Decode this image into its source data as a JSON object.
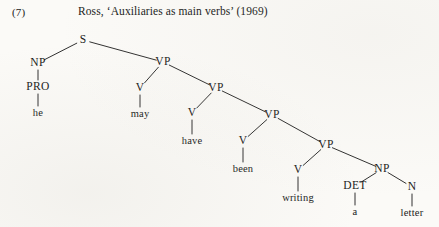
{
  "header": {
    "example_number": "(7)",
    "caption": "Ross, ‘Auxiliaries as main verbs’ (1969)"
  },
  "figure": {
    "kind": "syntax-tree",
    "sentence": "he may have been writing a letter",
    "ink_color": "#1a1a1a",
    "paper_color": "#fbfaf7"
  },
  "tree": {
    "nodes": [
      {
        "id": "S",
        "label": "S",
        "x": 83,
        "y": 40,
        "terminal": false
      },
      {
        "id": "NP1",
        "label": "NP",
        "x": 38,
        "y": 63,
        "terminal": false
      },
      {
        "id": "PRO",
        "label": "PRO",
        "x": 38,
        "y": 87,
        "terminal": false
      },
      {
        "id": "he",
        "label": "he",
        "x": 38,
        "y": 113,
        "terminal": true
      },
      {
        "id": "VP1",
        "label": "VP",
        "x": 163,
        "y": 62,
        "terminal": false
      },
      {
        "id": "V1",
        "label": "V",
        "x": 140,
        "y": 88,
        "terminal": false
      },
      {
        "id": "may",
        "label": "may",
        "x": 140,
        "y": 114,
        "terminal": true
      },
      {
        "id": "VP2",
        "label": "VP",
        "x": 216,
        "y": 88,
        "terminal": false
      },
      {
        "id": "V2",
        "label": "V",
        "x": 192,
        "y": 113,
        "terminal": false
      },
      {
        "id": "have",
        "label": "have",
        "x": 192,
        "y": 141,
        "terminal": true
      },
      {
        "id": "VP3",
        "label": "VP",
        "x": 272,
        "y": 115,
        "terminal": false
      },
      {
        "id": "V3",
        "label": "V",
        "x": 243,
        "y": 141,
        "terminal": false
      },
      {
        "id": "been",
        "label": "been",
        "x": 243,
        "y": 169,
        "terminal": true
      },
      {
        "id": "VP4",
        "label": "VP",
        "x": 326,
        "y": 145,
        "terminal": false
      },
      {
        "id": "V4",
        "label": "V",
        "x": 298,
        "y": 170,
        "terminal": false
      },
      {
        "id": "writing",
        "label": "writing",
        "x": 298,
        "y": 198,
        "terminal": true
      },
      {
        "id": "NP2",
        "label": "NP",
        "x": 382,
        "y": 169,
        "terminal": false
      },
      {
        "id": "DET",
        "label": "DET",
        "x": 355,
        "y": 186,
        "terminal": false
      },
      {
        "id": "a",
        "label": "a",
        "x": 355,
        "y": 212,
        "terminal": true
      },
      {
        "id": "N",
        "label": "N",
        "x": 412,
        "y": 187,
        "terminal": false
      },
      {
        "id": "letter",
        "label": "letter",
        "x": 412,
        "y": 213,
        "terminal": true
      }
    ],
    "edges": [
      {
        "from": "S",
        "to": "NP1"
      },
      {
        "from": "S",
        "to": "VP1"
      },
      {
        "from": "NP1",
        "to": "PRO"
      },
      {
        "from": "PRO",
        "to": "he"
      },
      {
        "from": "VP1",
        "to": "V1"
      },
      {
        "from": "VP1",
        "to": "VP2"
      },
      {
        "from": "V1",
        "to": "may"
      },
      {
        "from": "VP2",
        "to": "V2"
      },
      {
        "from": "VP2",
        "to": "VP3"
      },
      {
        "from": "V2",
        "to": "have"
      },
      {
        "from": "VP3",
        "to": "V3"
      },
      {
        "from": "VP3",
        "to": "VP4"
      },
      {
        "from": "V3",
        "to": "been"
      },
      {
        "from": "VP4",
        "to": "V4"
      },
      {
        "from": "VP4",
        "to": "NP2"
      },
      {
        "from": "V4",
        "to": "writing"
      },
      {
        "from": "NP2",
        "to": "DET"
      },
      {
        "from": "NP2",
        "to": "N"
      },
      {
        "from": "DET",
        "to": "a"
      },
      {
        "from": "N",
        "to": "letter"
      }
    ]
  }
}
